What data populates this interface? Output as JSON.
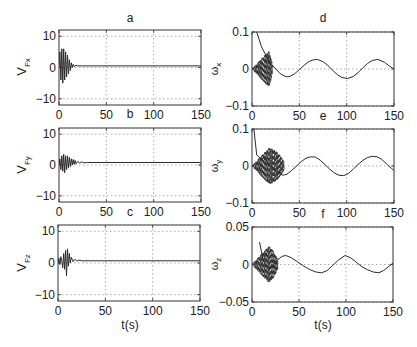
{
  "chart_data": [
    {
      "id": "a",
      "type": "line",
      "title": "a",
      "xlabel": "",
      "ylabel": "V_Fx",
      "ylabel_main": "V",
      "ylabel_sub": "Fx",
      "xlim": [
        0,
        150
      ],
      "ylim": [
        -12,
        12
      ],
      "xticks": [
        0,
        50,
        100,
        150
      ],
      "yticks": [
        -10,
        0,
        10
      ],
      "ytick_labels": [
        "−10",
        "0",
        "10"
      ],
      "grid": true,
      "series": [
        {
          "name": "V_Fx",
          "style": "solid",
          "description": "Damped oscillation from amplitude ~6 at t≈2-8s decaying to ~0.5 by t≈20s, then flat at ~0.5",
          "x": [
            0,
            1,
            2,
            3,
            4,
            5,
            6,
            7,
            8,
            9,
            10,
            11,
            12,
            13,
            14,
            15,
            16,
            18,
            20,
            25,
            150
          ],
          "y": [
            0,
            5,
            -4,
            6,
            -5,
            6,
            -4,
            5,
            -3,
            4,
            -2,
            2.5,
            -1,
            1.5,
            0,
            1,
            0.3,
            0.7,
            0.5,
            0.5,
            0.5
          ]
        }
      ]
    },
    {
      "id": "b",
      "type": "line",
      "title": "b",
      "xlabel": "",
      "ylabel": "V_Fy",
      "ylabel_main": "V",
      "ylabel_sub": "Fy",
      "xlim": [
        0,
        150
      ],
      "ylim": [
        -12,
        12
      ],
      "xticks": [
        0,
        50,
        100,
        150
      ],
      "yticks": [
        -10,
        0,
        10
      ],
      "ytick_labels": [
        "−10",
        "0",
        "10"
      ],
      "grid": true,
      "series": [
        {
          "name": "V_Fy",
          "style": "solid",
          "description": "Damped oscillation amplitude ~3, decays by t≈30s to ~0.8",
          "x": [
            0,
            1,
            2,
            3,
            4,
            5,
            6,
            7,
            8,
            9,
            10,
            11,
            12,
            13,
            14,
            15,
            16,
            17,
            18,
            20,
            22,
            24,
            26,
            30,
            150
          ],
          "y": [
            0,
            2,
            -1.5,
            3,
            -2,
            3.5,
            -2.5,
            3,
            -1.5,
            3,
            -1,
            2.5,
            -0.5,
            2,
            0,
            1.8,
            0.2,
            1.5,
            0.4,
            1.2,
            0.6,
            1,
            0.7,
            0.8,
            0.8
          ]
        }
      ]
    },
    {
      "id": "c",
      "type": "line",
      "title": "c",
      "xlabel": "t(s)",
      "ylabel": "V_Fz",
      "ylabel_main": "V",
      "ylabel_sub": "Fz",
      "xlim": [
        0,
        150
      ],
      "ylim": [
        -12,
        12
      ],
      "xticks": [
        0,
        50,
        100,
        150
      ],
      "yticks": [
        -10,
        0,
        10
      ],
      "ytick_labels": [
        "−10",
        "0",
        "10"
      ],
      "grid": true,
      "series": [
        {
          "name": "V_Fz",
          "style": "solid",
          "description": "Small oscillations with spikes near t≈7-10s (±4), settling at ~0.7 by t≈25s",
          "x": [
            0,
            1,
            2,
            3,
            4,
            5,
            6,
            7,
            8,
            9,
            10,
            11,
            12,
            13,
            14,
            16,
            18,
            20,
            22,
            25,
            150
          ],
          "y": [
            0,
            1.5,
            -0.5,
            2,
            0.5,
            -1.5,
            3,
            -2,
            4,
            -4,
            4.5,
            -1,
            3,
            0,
            1.8,
            0.4,
            1.2,
            0.6,
            0.9,
            0.7,
            0.7
          ]
        }
      ]
    },
    {
      "id": "d",
      "type": "line",
      "title": "d",
      "xlabel": "",
      "ylabel": "ω_x",
      "ylabel_main": "ω",
      "ylabel_sub": "x",
      "xlim": [
        0,
        150
      ],
      "ylim": [
        -0.1,
        0.1
      ],
      "xticks": [
        0,
        50,
        100,
        150
      ],
      "yticks": [
        -0.1,
        0,
        0.1
      ],
      "ytick_labels": [
        "−0.1",
        "0",
        "0.1"
      ],
      "grid": true,
      "series": [
        {
          "name": "ω_x (solid)",
          "style": "solid",
          "description": "Decays from 0.1 at t≈5 to min ≈ -0.02 at t≈37, then sinusoid amplitude ~0.025, period ~64s",
          "x": [
            5,
            10,
            15,
            20,
            25,
            30,
            35,
            37,
            40,
            45,
            50,
            55,
            60,
            65,
            69,
            75,
            80,
            85,
            90,
            95,
            101,
            107,
            112,
            117,
            122,
            127,
            133,
            140,
            145,
            150
          ],
          "y": [
            0.1,
            0.06,
            0.035,
            0.015,
            0.0,
            -0.013,
            -0.02,
            -0.021,
            -0.02,
            -0.013,
            -0.002,
            0.01,
            0.02,
            0.025,
            0.026,
            0.02,
            0.01,
            -0.003,
            -0.015,
            -0.023,
            -0.026,
            -0.02,
            -0.01,
            0.003,
            0.015,
            0.023,
            0.026,
            0.018,
            0.008,
            0.0
          ]
        },
        {
          "name": "ω_x (dashed)",
          "style": "dashed",
          "description": "High-frequency dashed oscillation filling ±0.1 for t in 0–20s, fading by t≈25s"
        }
      ]
    },
    {
      "id": "e",
      "type": "line",
      "title": "e",
      "xlabel": "",
      "ylabel": "ω_y",
      "ylabel_main": "ω",
      "ylabel_sub": "y",
      "xlim": [
        0,
        150
      ],
      "ylim": [
        -0.1,
        0.1
      ],
      "xticks": [
        0,
        50,
        100,
        150
      ],
      "yticks": [
        -0.1,
        0,
        0.1
      ],
      "ytick_labels": [
        "−0.1",
        "0",
        "0.1"
      ],
      "grid": true,
      "series": [
        {
          "name": "ω_y (solid)",
          "style": "solid",
          "description": "Starts at 0.02 around t≈8, dips to ≈ -0.025 at t≈33, then sinusoid amplitude ~0.025, period ~64s",
          "x": [
            2,
            5,
            8,
            12,
            16,
            20,
            25,
            30,
            33,
            37,
            42,
            47,
            52,
            57,
            62,
            67,
            72,
            77,
            82,
            87,
            92,
            97,
            102,
            107,
            112,
            117,
            122,
            127,
            132,
            137,
            142,
            147,
            150
          ],
          "y": [
            0.1,
            0.03,
            0.022,
            0.02,
            0.012,
            0.002,
            -0.012,
            -0.022,
            -0.025,
            -0.022,
            -0.012,
            0.0,
            0.012,
            0.021,
            0.025,
            0.024,
            0.016,
            0.004,
            -0.008,
            -0.019,
            -0.025,
            -0.026,
            -0.02,
            -0.008,
            0.004,
            0.015,
            0.023,
            0.026,
            0.025,
            0.018,
            0.006,
            -0.006,
            -0.012
          ]
        },
        {
          "name": "ω_y (dashed)",
          "style": "dashed",
          "description": "High-frequency dashed oscillation filling ±0.1 for t in 0–20s, decaying by t≈35s"
        }
      ]
    },
    {
      "id": "f",
      "type": "line",
      "title": "f",
      "xlabel": "t(s)",
      "ylabel": "ω_z",
      "ylabel_main": "ω",
      "ylabel_sub": "z",
      "xlim": [
        0,
        150
      ],
      "ylim": [
        -0.05,
        0.05
      ],
      "xticks": [
        0,
        50,
        100,
        150
      ],
      "yticks": [
        -0.05,
        0,
        0.05
      ],
      "ytick_labels": [
        "−0.05",
        "0",
        "0.05"
      ],
      "grid": true,
      "series": [
        {
          "name": "ω_z (solid)",
          "style": "solid",
          "description": "Drops to ≈ -0.005 at t≈17, rises to 0.012 at t≈35, then oscillates between ≈ -0.011 and 0.012 with period ~64s",
          "x": [
            8,
            12,
            17,
            22,
            27,
            32,
            36,
            42,
            48,
            55,
            62,
            68,
            74,
            80,
            86,
            92,
            99,
            105,
            111,
            117,
            123,
            129,
            135,
            140,
            145,
            150
          ],
          "y": [
            0.03,
            0.005,
            -0.005,
            -0.002,
            0.006,
            0.011,
            0.012,
            0.009,
            0.004,
            -0.002,
            -0.007,
            -0.01,
            -0.011,
            -0.008,
            -0.001,
            0.006,
            0.012,
            0.009,
            0.003,
            -0.003,
            -0.007,
            -0.01,
            -0.011,
            -0.008,
            -0.003,
            0.002
          ]
        },
        {
          "name": "ω_z (dashed)",
          "style": "dashed",
          "description": "High-frequency dashed oscillation filling ±0.05 for t in 0–20s, decaying by t≈30s"
        }
      ]
    }
  ],
  "panels": {
    "a": {
      "title": "a",
      "ylabel_main": "V",
      "ylabel_sub": "Fx"
    },
    "b": {
      "title": "b",
      "ylabel_main": "V",
      "ylabel_sub": "Fy"
    },
    "c": {
      "title": "c",
      "ylabel_main": "V",
      "ylabel_sub": "Fz",
      "xlabel": "t(s)"
    },
    "d": {
      "title": "d",
      "ylabel_main": "ω",
      "ylabel_sub": "x"
    },
    "e": {
      "title": "e",
      "ylabel_main": "ω",
      "ylabel_sub": "y"
    },
    "f": {
      "title": "f",
      "ylabel_main": "ω",
      "ylabel_sub": "z",
      "xlabel": "t(s)"
    }
  },
  "colors": {
    "line": "#2a2a2a",
    "axis": "#333333",
    "grid": "#888888",
    "background": "#ffffff"
  }
}
